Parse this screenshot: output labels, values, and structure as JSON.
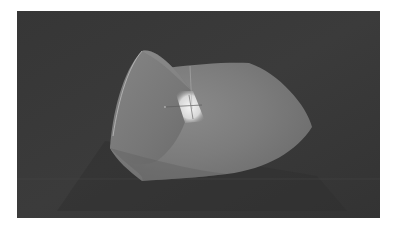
{
  "scene": {
    "description": "3D rendered curved surface patch in a dark viewport",
    "viewport_background": "#3a3a3a",
    "frame_background": "#ffffff",
    "surface": {
      "base_color": "#7e7e7e",
      "shadow_color": "#5a5a5a",
      "highlight_color": "#e8e8e8",
      "edge_curve_color": "#c8c8c8"
    },
    "gizmo": {
      "type": "crosshair",
      "color": "#555555"
    },
    "ground_line_color": "#4a4a4a"
  }
}
